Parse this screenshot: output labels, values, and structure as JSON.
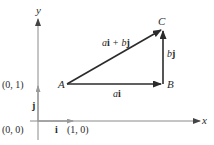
{
  "diagram": {
    "axes": {
      "x_label": "x",
      "y_label": "y"
    },
    "points": {
      "origin_label": "(0, 0)",
      "unit_y_label": "(0, 1)",
      "unit_x_label": "(1, 0)",
      "A": "A",
      "B": "B",
      "C": "C"
    },
    "vectors": {
      "i_label": "i",
      "j_label": "j",
      "AB": {
        "coef": "a",
        "unit": "i"
      },
      "BC": {
        "coef": "b",
        "unit": "j"
      },
      "AC": {
        "coef1": "a",
        "unit1": "i",
        "plus": "+",
        "coef2": "b",
        "unit2": "j"
      }
    },
    "colors": {
      "axis": "#8a8a8a",
      "vector": "#2b2b2b",
      "unit_vector": "#9a9a9a",
      "text": "#2a2a2a"
    }
  }
}
